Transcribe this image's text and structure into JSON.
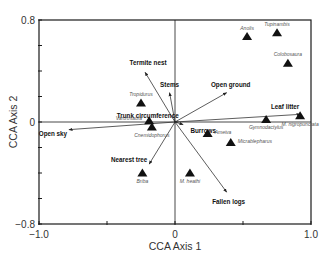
{
  "chart_data": {
    "type": "scatter",
    "subtype": "CCA biplot",
    "title": "",
    "xlabel": "CCA Axis 1",
    "ylabel": "CCA Axis 2",
    "xlim": [
      -1.0,
      1.0
    ],
    "ylim": [
      -0.8,
      0.8
    ],
    "x_ticks": [
      -1.0,
      -0.5,
      0,
      0.5,
      1.0
    ],
    "x_tick_labels": [
      "−1.0",
      "",
      "0",
      "",
      "1.0"
    ],
    "y_ticks": [
      -0.8,
      -0.6,
      -0.4,
      -0.2,
      0,
      0.2,
      0.4,
      0.6,
      0.8
    ],
    "y_tick_labels": [
      "−0.8",
      "",
      "",
      "",
      "0",
      "",
      "",
      "",
      "0.8"
    ],
    "grid": false,
    "zero_lines": true,
    "species": [
      {
        "name": "Anolis",
        "x": 0.53,
        "y": 0.67,
        "label_pos": "above"
      },
      {
        "name": "Tupinambis",
        "x": 0.75,
        "y": 0.7,
        "label_pos": "above"
      },
      {
        "name": "Colobosaura",
        "x": 0.83,
        "y": 0.46,
        "label_pos": "above"
      },
      {
        "name": "Tropidurus",
        "x": -0.25,
        "y": 0.15,
        "label_pos": "above"
      },
      {
        "name": "Vanzosaura",
        "x": -0.19,
        "y": 0.01,
        "label_pos": "left"
      },
      {
        "name": "Cnemidophorus",
        "x": -0.17,
        "y": -0.04,
        "label_pos": "below"
      },
      {
        "name": "Gymnodactylus",
        "x": 0.67,
        "y": 0.02,
        "label_pos": "below"
      },
      {
        "name": "M. nigropunctata",
        "x": 0.92,
        "y": 0.05,
        "label_pos": "below"
      },
      {
        "name": "Ameiva",
        "x": 0.24,
        "y": -0.09,
        "label_pos": "right"
      },
      {
        "name": "Micrablepharus",
        "x": 0.41,
        "y": -0.16,
        "label_pos": "right"
      },
      {
        "name": "Briba",
        "x": -0.24,
        "y": -0.4,
        "label_pos": "below"
      },
      {
        "name": "M. heathi",
        "x": 0.11,
        "y": -0.4,
        "label_pos": "below"
      }
    ],
    "environmental_vectors": [
      {
        "name": "Termite nest",
        "x": -0.22,
        "y": 0.39,
        "label_dx": 3,
        "label_dy": -7
      },
      {
        "name": "Stems",
        "x": -0.04,
        "y": 0.23,
        "label_dx": 0,
        "label_dy": -6
      },
      {
        "name": "Open ground",
        "x": 0.38,
        "y": 0.23,
        "label_dx": 4,
        "label_dy": -6
      },
      {
        "name": "Leaf litter",
        "x": 0.92,
        "y": 0.06,
        "label_dx": -15,
        "label_dy": -5
      },
      {
        "name": "Trunk circumference",
        "x": 0.02,
        "y": 0.0,
        "label_dx": -30,
        "label_dy": -4
      },
      {
        "name": "Burrows",
        "x": 0.06,
        "y": -0.02,
        "label_dx": 20,
        "label_dy": 8
      },
      {
        "name": "Open sky",
        "x": -0.78,
        "y": -0.06,
        "label_dx": -16,
        "label_dy": 6
      },
      {
        "name": "Nearest tree",
        "x": -0.19,
        "y": -0.33,
        "label_dx": -20,
        "label_dy": -2
      },
      {
        "name": "Fallen logs",
        "x": 0.38,
        "y": -0.55,
        "label_dx": 2,
        "label_dy": 12
      }
    ]
  },
  "colors": {
    "frame": "#1a1a1a",
    "arrows": "#333333",
    "markers": "#111111",
    "species_text": "#555555",
    "variable_text": "#111111"
  }
}
